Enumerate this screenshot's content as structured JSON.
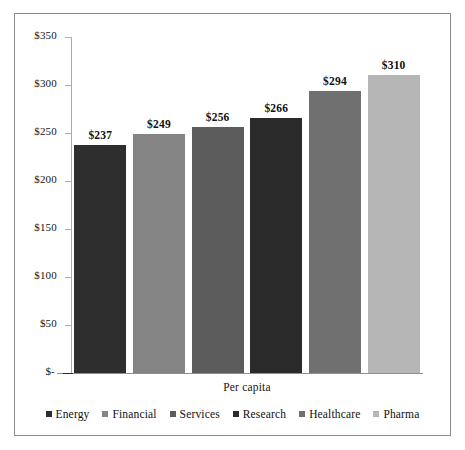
{
  "chart_data": {
    "type": "bar",
    "title": "",
    "subtitle": "",
    "xlabel": "Per capita",
    "ylabel": "",
    "categories": [
      "Energy",
      "Financial",
      "Services",
      "Research",
      "Healthcare",
      "Pharma"
    ],
    "values": [
      237,
      249,
      256,
      266,
      294,
      310
    ],
    "data_labels": [
      "$237",
      "$249",
      "$256",
      "$266",
      "$294",
      "$310"
    ],
    "ylim": [
      0,
      350
    ],
    "y_ticks": [
      350,
      300,
      250,
      200,
      150,
      100,
      50,
      0
    ],
    "y_tick_labels": [
      "$350",
      "$300",
      "$250",
      "$200",
      "$150",
      "$100",
      "$50",
      "$-"
    ],
    "grid": false,
    "legend_position": "bottom",
    "series": [
      {
        "name": "Energy",
        "value": 237,
        "label": "$237",
        "color": "#2e2e2e"
      },
      {
        "name": "Financial",
        "value": 249,
        "label": "$249",
        "color": "#848484"
      },
      {
        "name": "Services",
        "value": 256,
        "label": "$256",
        "color": "#5c5c5c"
      },
      {
        "name": "Research",
        "value": 266,
        "label": "$266",
        "color": "#2b2b2b"
      },
      {
        "name": "Healthcare",
        "value": 294,
        "label": "$294",
        "color": "#707070"
      },
      {
        "name": "Pharma",
        "value": 310,
        "label": "$310",
        "color": "#b6b6b6"
      }
    ],
    "colors": {
      "border": "#8a8a8a",
      "axis": "#a9a9a9",
      "baseline": "#8f8f8f",
      "text": "#151515",
      "background": "#ffffff"
    }
  },
  "legend": {
    "items": [
      {
        "label": "Energy",
        "color": "#2e2e2e"
      },
      {
        "label": "Financial",
        "color": "#848484"
      },
      {
        "label": "Services",
        "color": "#5c5c5c"
      },
      {
        "label": "Research",
        "color": "#2b2b2b"
      },
      {
        "label": "Healthcare",
        "color": "#707070"
      },
      {
        "label": "Pharma",
        "color": "#b6b6b6"
      }
    ]
  }
}
